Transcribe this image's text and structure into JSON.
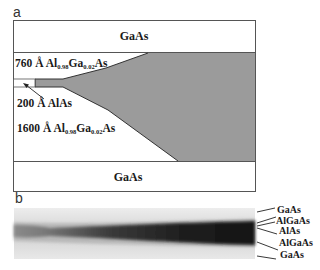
{
  "panel_a": {
    "letter": "a",
    "top_layer": "GaAs",
    "bottom_layer": "GaAs",
    "upper_cladding": {
      "thickness": "760 Å",
      "prefix": "Al",
      "al_sub": "0.98",
      "mid": "Ga",
      "ga_sub": "0.02",
      "suffix": "As"
    },
    "core": {
      "label": "200 Å AlAs"
    },
    "lower_cladding": {
      "thickness": "1600 Å",
      "prefix": "Al",
      "al_sub": "0.98",
      "mid": "Ga",
      "ga_sub": "0.02",
      "suffix": "As"
    },
    "colors": {
      "oxide_fill": "#9b9b9b",
      "outline": "#444444",
      "background": "#ffffff"
    }
  },
  "panel_b": {
    "letter": "b",
    "layer_labels": [
      "GaAs",
      "AlGaAs",
      "AlAs",
      "AlGaAs",
      "GaAs"
    ]
  }
}
